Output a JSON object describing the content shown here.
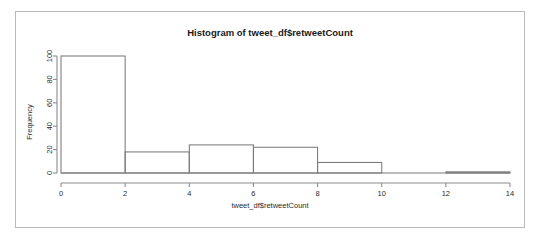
{
  "chart_data": {
    "type": "bar",
    "title": "Histogram of tweet_df$retweetCount",
    "xlabel": "tweet_df$retweetCount",
    "ylabel": "Frequency",
    "xlim": [
      0,
      14
    ],
    "ylim": [
      0,
      100
    ],
    "grid": false,
    "legend": null,
    "bin_width": 2,
    "bin_edges": [
      0,
      2,
      4,
      6,
      8,
      10,
      12,
      14
    ],
    "categories": [
      "0-2",
      "2-4",
      "4-6",
      "6-8",
      "8-10",
      "10-12",
      "12-14"
    ],
    "values": [
      100,
      18,
      24,
      22,
      9,
      0,
      1
    ],
    "bars": [
      {
        "x0": 0,
        "x1": 2,
        "height": 100
      },
      {
        "x0": 2,
        "x1": 4,
        "height": 18
      },
      {
        "x0": 4,
        "x1": 6,
        "height": 24
      },
      {
        "x0": 6,
        "x1": 8,
        "height": 22
      },
      {
        "x0": 8,
        "x1": 10,
        "height": 9
      },
      {
        "x0": 10,
        "x1": 12,
        "height": 0
      },
      {
        "x0": 12,
        "x1": 14,
        "height": 1
      }
    ],
    "x_ticks": [
      "0",
      "2",
      "4",
      "6",
      "8",
      "10",
      "12",
      "14"
    ],
    "x_tick_values": [
      0,
      2,
      4,
      6,
      8,
      10,
      12,
      14
    ],
    "y_ticks": [
      "0",
      "20",
      "40",
      "60",
      "80",
      "100"
    ],
    "y_tick_values": [
      0,
      20,
      40,
      60,
      80,
      100
    ],
    "colors": {
      "background": "#ffffff",
      "bar_stroke": "#7a7a7a",
      "bar_fill": "none",
      "axis": "#8c8c8c",
      "text": "#2b2b2b",
      "frame": "#b9b9b9"
    }
  }
}
